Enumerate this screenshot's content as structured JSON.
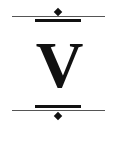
{
  "ornament": {
    "letter": "V",
    "colors": {
      "ink": "#111111",
      "rule": "#555555",
      "background": "#ffffff"
    },
    "top": {
      "icons": [
        "diamond-icon"
      ]
    },
    "bottom": {
      "icons": [
        "diamond-icon"
      ]
    }
  }
}
